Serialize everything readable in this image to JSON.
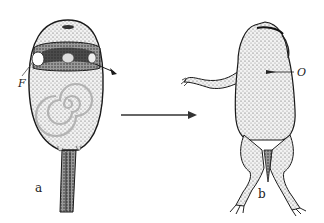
{
  "figure": {
    "panels": [
      {
        "id": "a",
        "label": "a",
        "subject": "tadpole"
      },
      {
        "id": "b",
        "label": "b",
        "subject": "frog"
      }
    ],
    "annotations": [
      {
        "id": "F",
        "text": "F",
        "panel": "a"
      },
      {
        "id": "O",
        "text": "O",
        "panel": "b"
      }
    ],
    "arrow": {
      "from": "a",
      "to": "b"
    },
    "colors": {
      "ink": "#1a1a1a",
      "stipple": "#bdbdbd",
      "background": "#ffffff"
    }
  }
}
